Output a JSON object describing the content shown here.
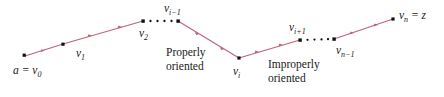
{
  "figure": {
    "type": "polygonal-path-diagram",
    "background": "#ffffff",
    "line_color": "#bf6277",
    "vertex_color": "#111111",
    "vertices": [
      {
        "id": "v0",
        "label_html": "a = v<sub>0</sub>",
        "x": 25,
        "y": 56,
        "label_x": 13,
        "label_y": 65
      },
      {
        "id": "v1",
        "label_html": "v<sub>1</sub>",
        "x": 63,
        "y": 44,
        "label_x": 76,
        "label_y": 48
      },
      {
        "id": "v2",
        "label_html": "v<sub>2</sub>",
        "x": 143,
        "y": 21,
        "label_x": 139,
        "label_y": 28
      },
      {
        "id": "vim1",
        "label_html": "v<sub>i−1</sub>",
        "x": 178,
        "y": 21,
        "label_x": 164,
        "label_y": 3
      },
      {
        "id": "vi",
        "label_html": "v<sub>i</sub>",
        "x": 239,
        "y": 58,
        "label_x": 233,
        "label_y": 66
      },
      {
        "id": "vip1",
        "label_html": "v<sub>i+1</sub>",
        "x": 300,
        "y": 40,
        "label_x": 289,
        "label_y": 22
      },
      {
        "id": "vnm1",
        "label_html": "v<sub>n−1</sub>",
        "x": 334,
        "y": 39,
        "label_x": 336,
        "label_y": 45
      },
      {
        "id": "vn",
        "label_html": "v<sub>n</sub> = z",
        "x": 393,
        "y": 19,
        "label_x": 399,
        "label_y": 10
      }
    ],
    "captions": [
      {
        "id": "properly-oriented",
        "line1": "Properly",
        "line2": "oriented",
        "x": 166,
        "y": 46
      },
      {
        "id": "improperly-oriented",
        "line1": "Improperly",
        "line2": "oriented",
        "x": 268,
        "y": 58
      }
    ],
    "segments": [
      {
        "from": "v0",
        "to": "v1",
        "style": "solid-arrow",
        "arrows": 1
      },
      {
        "from": "v1",
        "to": "v2",
        "style": "solid-arrow",
        "arrows": 2
      },
      {
        "from": "v2",
        "to": "vim1",
        "style": "dotted",
        "arrows": 0
      },
      {
        "from": "vim1",
        "to": "vi",
        "style": "solid-arrow",
        "arrows": 2
      },
      {
        "from": "vi",
        "to": "vip1",
        "style": "solid-arrow",
        "arrows": 2
      },
      {
        "from": "vip1",
        "to": "vnm1",
        "style": "dotted",
        "arrows": 0
      },
      {
        "from": "vnm1",
        "to": "vn",
        "style": "solid-arrow",
        "arrows": 2
      }
    ]
  }
}
